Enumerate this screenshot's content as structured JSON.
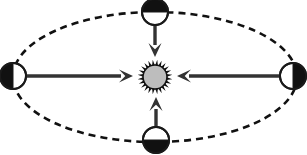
{
  "figure": {
    "type": "astronomy-orbit-diagram",
    "background_color": "#ffffff",
    "width": 307,
    "height": 155
  },
  "colors": {
    "stroke": "#1a1a1a",
    "dark_hemisphere": "#111111",
    "light_hemisphere": "#ffffff",
    "sun_disc": "#bdbdbd",
    "sun_corona": "#111111",
    "arrow": "#333333",
    "orbit_dash": "#111111"
  },
  "orbit": {
    "name": "elliptical-orbit-path",
    "center_x": 155,
    "center_y": 77,
    "semi_major_axis": 142,
    "semi_minor_axis": 65,
    "line_style": "dashed",
    "dash_length": 7,
    "dash_gap": 5,
    "stroke_width": 2.6
  },
  "sun": {
    "name": "sun",
    "center_x": 155,
    "center_y": 77,
    "disc_radius": 12,
    "corona_outer_radius": 17.5,
    "corona_spike_count": 24,
    "fill": "#bdbdbd",
    "outline": "#111111"
  },
  "planets": [
    {
      "name": "planet-left",
      "position": "left",
      "center_x": 13,
      "center_y": 76,
      "radius": 13,
      "dark_side": "left",
      "rotation_deg": 180,
      "description": "Planet at left orbital extreme, night side facing away from Sun"
    },
    {
      "name": "planet-top",
      "position": "top",
      "center_x": 155,
      "center_y": 12,
      "radius": 13,
      "dark_side": "top",
      "rotation_deg": 270,
      "description": "Planet at top orbital extreme, night side facing away from Sun"
    },
    {
      "name": "planet-right",
      "position": "right",
      "center_x": 293,
      "center_y": 76,
      "radius": 13,
      "dark_side": "right",
      "rotation_deg": 0,
      "description": "Planet at right orbital extreme, night side facing away from Sun"
    },
    {
      "name": "planet-bottom",
      "position": "bottom",
      "center_x": 156,
      "center_y": 140,
      "radius": 13,
      "dark_side": "bottom",
      "rotation_deg": 90,
      "description": "Planet at bottom orbital extreme, night side facing away from Sun"
    }
  ],
  "arrows": [
    {
      "name": "force-arrow-left",
      "from_x": 27,
      "from_y": 76,
      "to_x": 133,
      "to_y": 76,
      "direction": "right",
      "points_toward": "sun",
      "shaft_width": 3.4,
      "head_length": 14,
      "head_width": 13
    },
    {
      "name": "force-arrow-right",
      "from_x": 279,
      "from_y": 76,
      "to_x": 177,
      "to_y": 76,
      "direction": "left",
      "points_toward": "sun",
      "shaft_width": 3.4,
      "head_length": 14,
      "head_width": 13
    },
    {
      "name": "force-arrow-top",
      "from_x": 155,
      "from_y": 24,
      "to_x": 155,
      "to_y": 57,
      "direction": "down",
      "points_toward": "sun",
      "shaft_width": 3.4,
      "head_length": 14,
      "head_width": 13
    },
    {
      "name": "force-arrow-bottom",
      "from_x": 156,
      "from_y": 128,
      "to_x": 156,
      "to_y": 97,
      "direction": "up",
      "points_toward": "sun",
      "shaft_width": 3.4,
      "head_length": 14,
      "head_width": 13
    }
  ]
}
